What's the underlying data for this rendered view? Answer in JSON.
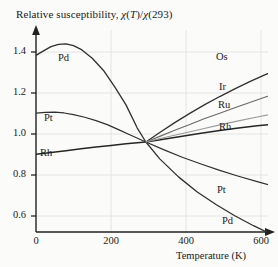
{
  "figure": {
    "title_prefix": "Relative susceptibility, ",
    "title_chi1": "χ",
    "title_t": "(T)/",
    "title_chi2": "χ",
    "title_ref": "(293)",
    "title_plain": "Relative susceptibility, χ(T)/χ(293)",
    "background_color": "#fbfbf9",
    "axis_color": "#222222",
    "grid_color": "#e2e2e2"
  },
  "chart_data": {
    "type": "line",
    "title": "Relative susceptibility, χ(T)/χ(293)",
    "xlabel": "Temperature (K)",
    "ylabel": "Relative susceptibility, χ(T)/χ(293)",
    "xlim": [
      0,
      680
    ],
    "ylim": [
      0.52,
      1.47
    ],
    "xticks": [
      0,
      200,
      400,
      600
    ],
    "xtick_labels": [
      "0",
      "200",
      "400",
      "600"
    ],
    "yticks": [
      0.6,
      0.8,
      1.0,
      1.2,
      1.4
    ],
    "ytick_labels": [
      "0.6",
      "0.8",
      "1.0",
      "1.2",
      "1.4"
    ],
    "grid": true,
    "legend": "inline-curve-labels",
    "normalization_point": {
      "x": 293,
      "y": 1.0
    },
    "series": [
      {
        "name": "Pd",
        "label": "Pd",
        "label_position": "upper-left",
        "color": "#303030",
        "width": 1.3,
        "x": [
          0,
          20,
          40,
          60,
          80,
          100,
          120,
          150,
          180,
          210,
          240,
          270,
          293,
          330,
          380,
          430,
          480,
          530,
          580,
          630,
          665
        ],
        "y": [
          1.385,
          1.405,
          1.424,
          1.434,
          1.436,
          1.428,
          1.412,
          1.372,
          1.318,
          1.245,
          1.165,
          1.062,
          1.0,
          0.925,
          0.845,
          0.778,
          0.722,
          0.672,
          0.628,
          0.588,
          0.562
        ]
      },
      {
        "name": "Pt",
        "label": "Pt",
        "label_position": "left-and-right",
        "color": "#303030",
        "width": 1.2,
        "x": [
          0,
          25,
          50,
          75,
          100,
          130,
          160,
          190,
          220,
          250,
          293,
          340,
          390,
          440,
          490,
          540,
          590,
          640,
          655
        ],
        "y": [
          1.128,
          1.132,
          1.133,
          1.129,
          1.122,
          1.11,
          1.095,
          1.077,
          1.055,
          1.032,
          1.0,
          0.966,
          0.932,
          0.902,
          0.874,
          0.848,
          0.824,
          0.8,
          0.793
        ]
      },
      {
        "name": "Rh",
        "label": "Rh",
        "label_position": "left-and-right",
        "color": "#262626",
        "width": 1.5,
        "x": [
          0,
          40,
          80,
          120,
          160,
          200,
          240,
          293,
          340,
          390,
          440,
          490,
          540,
          590,
          640,
          660
        ],
        "y": [
          0.945,
          0.953,
          0.961,
          0.97,
          0.978,
          0.985,
          0.992,
          1.0,
          1.012,
          1.026,
          1.039,
          1.051,
          1.062,
          1.072,
          1.081,
          1.084
        ]
      },
      {
        "name": "Os",
        "label": "Os",
        "label_position": "right",
        "color": "#303030",
        "width": 1.3,
        "x": [
          293,
          330,
          370,
          410,
          450,
          490,
          530,
          570,
          610,
          650,
          662
        ],
        "y": [
          1.0,
          1.042,
          1.086,
          1.127,
          1.166,
          1.202,
          1.236,
          1.268,
          1.298,
          1.327,
          1.335
        ]
      },
      {
        "name": "Ir",
        "label": "Ir",
        "label_position": "right",
        "color": "#6a6a6a",
        "width": 1.1,
        "x": [
          293,
          330,
          370,
          410,
          450,
          490,
          530,
          570,
          610,
          650,
          660
        ],
        "y": [
          1.0,
          1.025,
          1.052,
          1.078,
          1.104,
          1.128,
          1.152,
          1.176,
          1.199,
          1.221,
          1.227
        ]
      },
      {
        "name": "Ru",
        "label": "Ru",
        "label_position": "right",
        "color": "#9a9a9a",
        "width": 1.1,
        "x": [
          293,
          340,
          390,
          440,
          490,
          540,
          590,
          640,
          660
        ],
        "y": [
          1.0,
          1.019,
          1.038,
          1.057,
          1.076,
          1.094,
          1.111,
          1.128,
          1.134
        ]
      }
    ],
    "curve_labels": [
      {
        "text": "Pd",
        "x": 58,
        "y": 53
      },
      {
        "text": "Pt",
        "x": 44,
        "y": 113
      },
      {
        "text": "Rh",
        "x": 40,
        "y": 148
      },
      {
        "text": "Os",
        "x": 216,
        "y": 52
      },
      {
        "text": "Ir",
        "x": 219,
        "y": 82
      },
      {
        "text": "Ru",
        "x": 218,
        "y": 100
      },
      {
        "text": "Rh",
        "x": 219,
        "y": 122
      },
      {
        "text": "Pt",
        "x": 217,
        "y": 185
      },
      {
        "text": "Pd",
        "x": 222,
        "y": 216
      }
    ]
  },
  "axis_titles": {
    "x": "Temperature (K)"
  }
}
